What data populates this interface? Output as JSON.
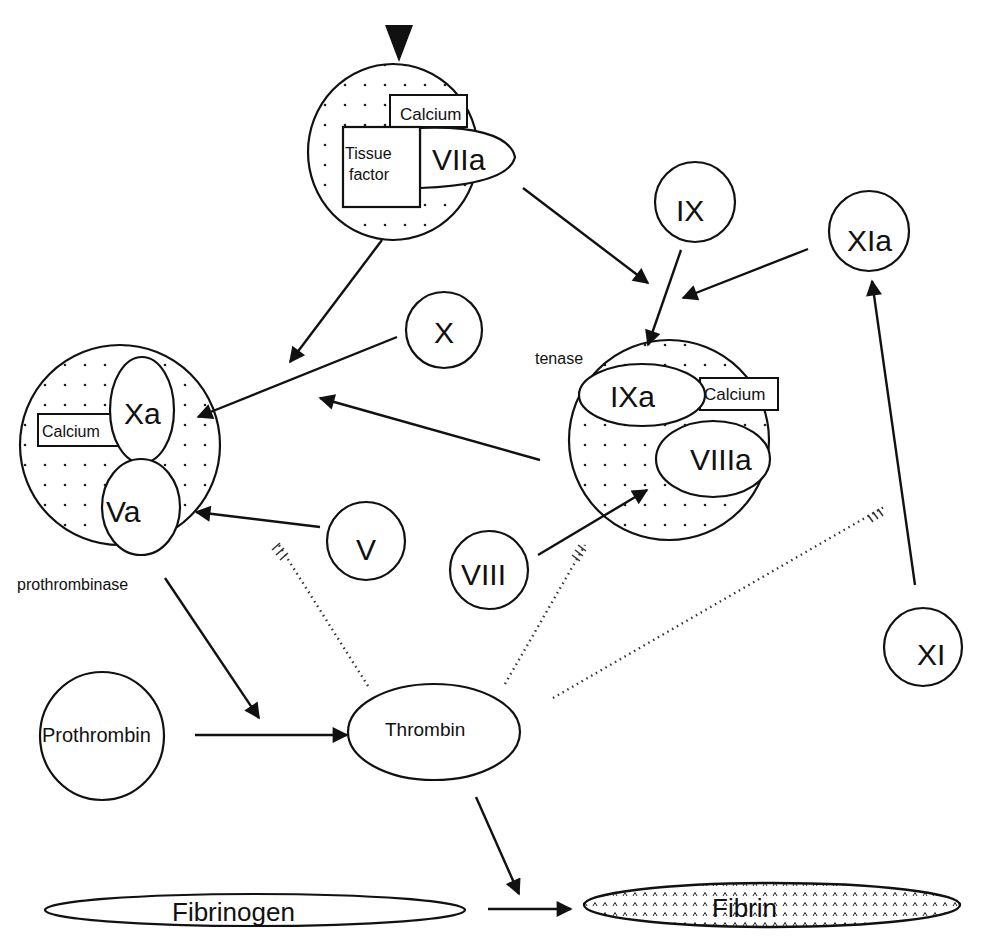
{
  "diagram": {
    "nodes": {
      "tf_complex": {
        "tissue_factor": "Tissue",
        "tissue_factor2": "factor",
        "calcium": "Calcium",
        "factor": "VIIa"
      },
      "prothrombinase": {
        "label": "prothrombinase",
        "calcium": "Calcium",
        "xa": "Xa",
        "va": "Va"
      },
      "tenase": {
        "label": "tenase",
        "ixa": "IXa",
        "calcium": "Calcium",
        "viiia": "VIIIa"
      },
      "ix": "IX",
      "xia": "XIa",
      "x": "X",
      "v": "V",
      "viii": "VIII",
      "xi": "XI",
      "prothrombin": "Prothrombin",
      "thrombin": "Thrombin",
      "fibrinogen": "Fibrinogen",
      "fibrin": "Fibrin"
    },
    "edges": [
      {
        "from": "start",
        "to": "tf_complex",
        "type": "trigger"
      },
      {
        "from": "tf_complex",
        "to": "tenase",
        "type": "activates"
      },
      {
        "from": "tf_complex",
        "to": "prothrombinase",
        "type": "activates"
      },
      {
        "from": "ix",
        "to": "tenase",
        "type": "activates"
      },
      {
        "from": "xia",
        "to": "tenase",
        "type": "activates"
      },
      {
        "from": "x",
        "to": "prothrombinase",
        "type": "activates"
      },
      {
        "from": "tenase",
        "to": "prothrombinase",
        "type": "activates"
      },
      {
        "from": "v",
        "to": "prothrombinase",
        "type": "activates"
      },
      {
        "from": "viii",
        "to": "tenase",
        "type": "activates"
      },
      {
        "from": "xi",
        "to": "xia",
        "type": "activates"
      },
      {
        "from": "prothrombinase",
        "to": "thrombin",
        "type": "catalyzes"
      },
      {
        "from": "prothrombin",
        "to": "thrombin",
        "type": "converts"
      },
      {
        "from": "thrombin",
        "to": "fibrin",
        "type": "catalyzes"
      },
      {
        "from": "fibrinogen",
        "to": "fibrin",
        "type": "converts"
      },
      {
        "from": "thrombin",
        "to": "v",
        "type": "feedback"
      },
      {
        "from": "thrombin",
        "to": "viii",
        "type": "feedback"
      },
      {
        "from": "thrombin",
        "to": "xi",
        "type": "feedback"
      }
    ]
  }
}
